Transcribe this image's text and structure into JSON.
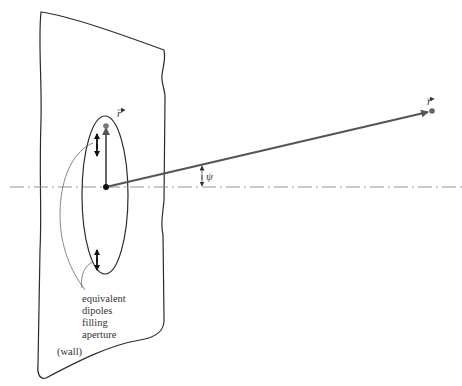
{
  "diagram": {
    "labels": {
      "r_prime": "r′",
      "r_vector": "r",
      "psi": "ψ",
      "dipoles_line1": "equivalent",
      "dipoles_line2": "dipoles",
      "dipoles_line3": "filling",
      "dipoles_line4": "aperture",
      "wall": "(wall)"
    },
    "colors": {
      "stroke": "#2b2b2b",
      "vector": "#555555",
      "axis": "#888888",
      "text": "#333333"
    }
  }
}
